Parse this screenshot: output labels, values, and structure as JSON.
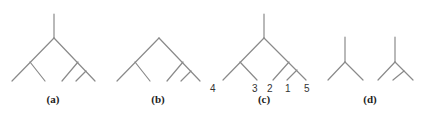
{
  "figure": {
    "panels": [
      {
        "id": "a",
        "caption": "(a)",
        "description": "Rooted binary tree with root stem, 5 leaves"
      },
      {
        "id": "b",
        "caption": "(b)",
        "description": "Same tree topology without root stem"
      },
      {
        "id": "c",
        "caption": "(c)",
        "description": "Rooted tree with labelled leaves",
        "leaf_labels": [
          "4",
          "3",
          "2",
          "1",
          "5"
        ]
      },
      {
        "id": "d",
        "caption": "(d)",
        "description": "Two small rooted trees (cherry and 3-leaf tree)"
      }
    ],
    "colors": {
      "edge": "#8a8a8a",
      "text": "#222222"
    }
  }
}
